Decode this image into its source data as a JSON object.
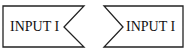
{
  "shapes": [
    {
      "label": "INPUT I",
      "notch_side": "right"
    },
    {
      "label": "INPUT I",
      "notch_side": "left"
    }
  ],
  "colors": {
    "stroke": "#222222",
    "background": "#ffffff",
    "text": "#111111"
  }
}
